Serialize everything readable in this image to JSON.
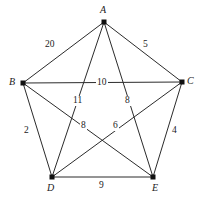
{
  "figure": {
    "type": "weighted-graph",
    "background_color": "#ffffff",
    "edge_color": "#2b2b2b",
    "vertex_color": "#111111",
    "label_color": "#1a1a1a"
  },
  "chart_data": {
    "type": "diagram",
    "title": "",
    "xlabel": "",
    "ylabel": "",
    "graph_kind": "complete-graph-K5",
    "vertices": [
      {
        "id": "A",
        "label": "A",
        "x": 104,
        "y": 22,
        "label_x": 100,
        "label_y": 5
      },
      {
        "id": "B",
        "label": "B",
        "x": 23,
        "y": 83,
        "label_x": 9,
        "label_y": 77
      },
      {
        "id": "C",
        "label": "C",
        "x": 182,
        "y": 82,
        "label_x": 187,
        "label_y": 76
      },
      {
        "id": "D",
        "label": "D",
        "x": 52,
        "y": 177,
        "label_x": 47,
        "label_y": 183
      },
      {
        "id": "E",
        "label": "E",
        "x": 153,
        "y": 177,
        "label_x": 152,
        "label_y": 183
      }
    ],
    "edges": [
      {
        "from": "A",
        "to": "B",
        "weight": "20",
        "label_x": 44,
        "label_y": 40
      },
      {
        "from": "A",
        "to": "C",
        "weight": "5",
        "label_x": 142,
        "label_y": 40
      },
      {
        "from": "B",
        "to": "C",
        "weight": "10",
        "label_x": 96,
        "label_y": 78
      },
      {
        "from": "A",
        "to": "D",
        "weight": "11",
        "label_x": 72,
        "label_y": 96
      },
      {
        "from": "A",
        "to": "E",
        "weight": "8",
        "label_x": 124,
        "label_y": 96
      },
      {
        "from": "B",
        "to": "D",
        "weight": "2",
        "label_x": 23,
        "label_y": 126
      },
      {
        "from": "B",
        "to": "E",
        "weight": "8",
        "label_x": 80,
        "label_y": 121
      },
      {
        "from": "C",
        "to": "D",
        "weight": "6",
        "label_x": 112,
        "label_y": 121
      },
      {
        "from": "C",
        "to": "E",
        "weight": "4",
        "label_x": 171,
        "label_y": 126
      },
      {
        "from": "D",
        "to": "E",
        "weight": "9",
        "label_x": 98,
        "label_y": 181
      }
    ]
  }
}
